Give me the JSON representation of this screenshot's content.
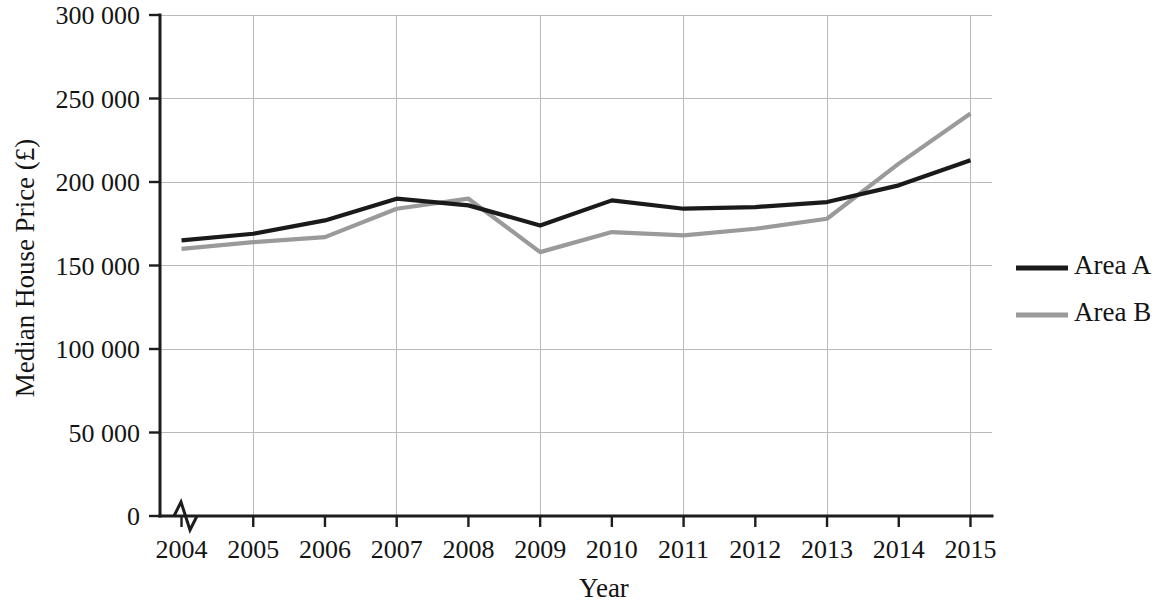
{
  "chart_data": {
    "type": "line",
    "title": "",
    "subtitle": "",
    "xlabel": "Year",
    "ylabel": "Median House Price (£)",
    "x": [
      2004,
      2005,
      2006,
      2007,
      2008,
      2009,
      2010,
      2011,
      2012,
      2013,
      2014,
      2015
    ],
    "xtick_labels": [
      "2004",
      "2005",
      "2006",
      "2007",
      "2008",
      "2009",
      "2010",
      "2011",
      "2012",
      "2013",
      "2014",
      "2015"
    ],
    "xlim": [
      2003.7,
      2015.3
    ],
    "ylim": [
      0,
      300000
    ],
    "ytick_values": [
      0,
      50000,
      100000,
      150000,
      200000,
      250000,
      300000
    ],
    "ytick_labels": [
      "0",
      "50 000",
      "100 000",
      "150 000",
      "200 000",
      "250 000",
      "300 000"
    ],
    "grid": {
      "horizontal": true,
      "vertical": true,
      "vertical_at": [
        2005,
        2007,
        2009,
        2011,
        2013,
        2015
      ],
      "color": "#b9b9b9"
    },
    "axis_break": {
      "present": true,
      "axis": "x",
      "description": "zigzag break symbol on x-axis near origin"
    },
    "legend": {
      "position": "right",
      "entries": [
        {
          "name": "Area A",
          "color": "#1a1a1a"
        },
        {
          "name": "Area B",
          "color": "#9a9a9a"
        }
      ]
    },
    "series": [
      {
        "name": "Area A",
        "color": "#1a1a1a",
        "values": [
          165000,
          169000,
          177000,
          190000,
          186000,
          174000,
          189000,
          184000,
          185000,
          188000,
          198000,
          213000
        ]
      },
      {
        "name": "Area B",
        "color": "#9a9a9a",
        "values": [
          160000,
          164000,
          167000,
          184000,
          190000,
          158000,
          170000,
          168000,
          172000,
          178000,
          211000,
          241000
        ]
      }
    ]
  }
}
